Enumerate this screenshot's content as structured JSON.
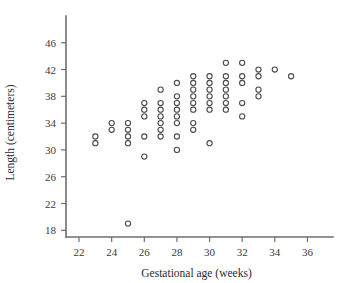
{
  "chart_data": {
    "type": "scatter",
    "title": "",
    "xlabel": "Gestational age (weeks)",
    "ylabel": "Length (centimeters)",
    "xlim": [
      21.2,
      37.2
    ],
    "ylim": [
      17.0,
      48.2
    ],
    "xticks": [
      22,
      24,
      26,
      28,
      30,
      32,
      34,
      36
    ],
    "yticks": [
      18,
      22,
      26,
      30,
      34,
      38,
      42,
      46
    ],
    "xtick_labels": [
      "22",
      "24",
      "26",
      "28",
      "30",
      "32",
      "34",
      "36"
    ],
    "ytick_labels": [
      "18",
      "22",
      "26",
      "30",
      "34",
      "38",
      "42",
      "46"
    ],
    "grid": false,
    "legend": null,
    "marker": "open-circle",
    "marker_color": "#4a4a4a",
    "x": [
      23,
      23,
      24,
      24,
      25,
      25,
      25,
      25,
      25,
      26,
      26,
      26,
      26,
      26,
      27,
      27,
      27,
      27,
      27,
      27,
      27,
      28,
      28,
      28,
      28,
      28,
      28,
      28,
      28,
      29,
      29,
      29,
      29,
      29,
      29,
      29,
      29,
      30,
      30,
      30,
      30,
      30,
      30,
      30,
      31,
      31,
      31,
      31,
      31,
      31,
      31,
      32,
      32,
      32,
      32,
      32,
      33,
      33,
      33,
      33,
      34,
      35
    ],
    "y": [
      32,
      31,
      34,
      33,
      34,
      33,
      32,
      31,
      19,
      37,
      36,
      35,
      32,
      29,
      39,
      37,
      36,
      35,
      34,
      33,
      32,
      40,
      38,
      37,
      36,
      35,
      34,
      32,
      30,
      41,
      40,
      39,
      38,
      37,
      36,
      34,
      33,
      41,
      40,
      39,
      38,
      37,
      36,
      31,
      43,
      41,
      40,
      39,
      38,
      37,
      36,
      43,
      41,
      40,
      37,
      35,
      42,
      41,
      39,
      38,
      42,
      41
    ]
  }
}
